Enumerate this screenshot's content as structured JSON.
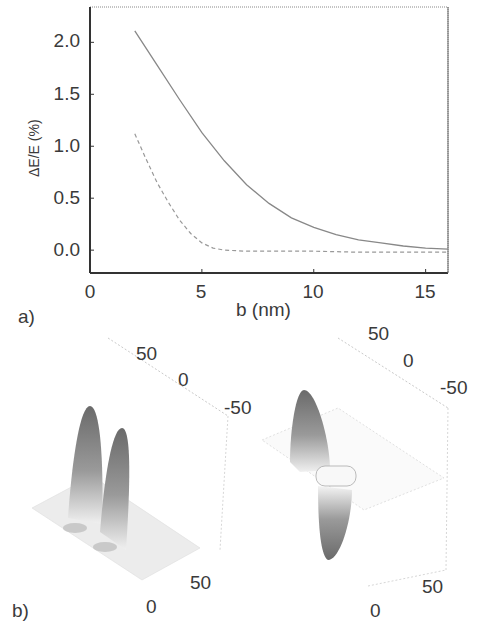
{
  "figure": {
    "panel_a_label": "a)",
    "panel_b_label": "b)"
  },
  "chart_data": [
    {
      "type": "line",
      "panel": "a)",
      "title": "",
      "xlabel": "b (nm)",
      "ylabel": "ΔE/E (%)",
      "xlim": [
        0,
        16
      ],
      "ylim": [
        -0.22,
        2.34
      ],
      "xticks": [
        "0",
        "5",
        "10",
        "15"
      ],
      "yticks": [
        "0.0",
        "0.5",
        "1.0",
        "1.5",
        "2.0"
      ],
      "grid": false,
      "legend": null,
      "series": [
        {
          "name": "solid",
          "style": "solid",
          "x": [
            2.0,
            3.0,
            4.0,
            5.0,
            6.0,
            7.0,
            8.0,
            9.0,
            10.0,
            11.0,
            12.0,
            13.0,
            14.0,
            15.0,
            16.0
          ],
          "y": [
            2.11,
            1.78,
            1.45,
            1.13,
            0.86,
            0.63,
            0.45,
            0.31,
            0.22,
            0.15,
            0.1,
            0.07,
            0.04,
            0.02,
            0.01
          ]
        },
        {
          "name": "dashed",
          "style": "dashed",
          "x": [
            2.0,
            2.5,
            3.0,
            3.5,
            4.0,
            4.5,
            5.0,
            5.5,
            6.0,
            7.0,
            8.0,
            10.0,
            12.0,
            14.0,
            16.0
          ],
          "y": [
            1.12,
            0.88,
            0.65,
            0.46,
            0.29,
            0.16,
            0.07,
            0.02,
            0.0,
            -0.01,
            -0.01,
            -0.01,
            -0.02,
            -0.02,
            -0.02
          ]
        }
      ]
    },
    {
      "type": "surface3d",
      "panel": "b) left",
      "description": "two positive peaks",
      "axis_ticks_top": [
        "50",
        "0",
        "-50"
      ],
      "axis_ticks_bottom": [
        "50",
        "0"
      ]
    },
    {
      "type": "surface3d",
      "panel": "b) right",
      "description": "one positive and one negative lobe",
      "axis_ticks_top": [
        "50",
        "0",
        "-50"
      ],
      "axis_ticks_bottom": [
        "50",
        "0"
      ]
    }
  ]
}
